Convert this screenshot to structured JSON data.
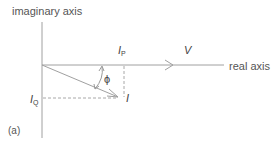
{
  "figure": {
    "panel_label": "(a)",
    "axes": {
      "imaginary_label": "imaginary axis",
      "real_label": "real axis"
    },
    "vectors": {
      "voltage": {
        "label": "V"
      },
      "current": {
        "label": "I"
      }
    },
    "components": {
      "in_phase": {
        "base": "I",
        "sub": "P"
      },
      "quadrature": {
        "base": "I",
        "sub": "Q"
      }
    },
    "angle": {
      "label": "ϕ"
    },
    "colors": {
      "line": "#9a9a9a",
      "text": "#4a4a4a"
    }
  }
}
